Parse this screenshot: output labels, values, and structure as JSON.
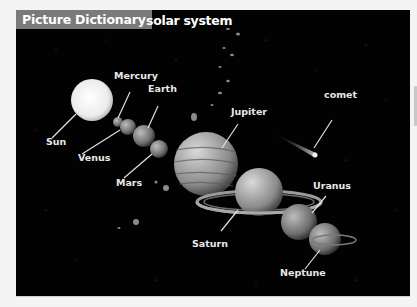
{
  "header": {
    "badge": "Picture Dictionary",
    "topic": "solar system"
  },
  "labels": {
    "sun": "Sun",
    "mercury": "Mercury",
    "venus": "Venus",
    "earth": "Earth",
    "mars": "Mars",
    "jupiter": "Jupiter",
    "saturn": "Saturn",
    "uranus": "Uranus",
    "neptune": "Neptune",
    "comet": "comet"
  },
  "colors": {
    "panel_bg": "#020202",
    "badge_bg": "#7a7a7a",
    "label_text": "#e8e8e8",
    "page_bg": "#f4f4f4"
  }
}
